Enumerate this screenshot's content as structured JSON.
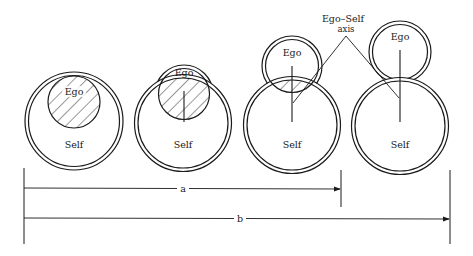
{
  "diagram": {
    "title": "",
    "colors": {
      "ink": "#1a1a1a",
      "background": "#ffffff"
    },
    "stages": [
      {
        "id": 1,
        "self_label": "Self",
        "ego_label": "Ego",
        "ego_relation": "ego contained within self, fully hatched"
      },
      {
        "id": 2,
        "self_label": "Self",
        "ego_label": "Ego",
        "ego_relation": "ego emerging, mostly overlapping self, with axis"
      },
      {
        "id": 3,
        "self_label": "Self",
        "ego_label": "Ego",
        "ego_relation": "ego largely separate, small hatched overlap, with axis"
      },
      {
        "id": 4,
        "self_label": "Self",
        "ego_label": "Ego",
        "ego_relation": "ego separate, connected only by axis"
      }
    ],
    "annotation": {
      "line1": "Ego–Self",
      "line2": "axis"
    },
    "dimensions": [
      {
        "label": "a",
        "spans": "stage 1 to stage 3"
      },
      {
        "label": "b",
        "spans": "stage 1 to stage 4"
      }
    ]
  }
}
